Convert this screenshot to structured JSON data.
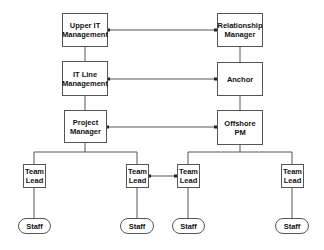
{
  "nodes": {
    "upper_it": {
      "label": "Upper IT Management"
    },
    "relationship_manager": {
      "label": "Relationship Manager"
    },
    "it_line": {
      "label": "IT Line Management"
    },
    "anchor": {
      "label": "Anchor"
    },
    "project_manager": {
      "label": "Project Manager"
    },
    "offshore_pm": {
      "label": "Offshore PM"
    },
    "team_lead_1": {
      "label": "Team Lead"
    },
    "team_lead_2": {
      "label": "Team Lead"
    },
    "team_lead_3": {
      "label": "Team Lead"
    },
    "team_lead_4": {
      "label": "Team Lead"
    },
    "staff_1": {
      "label": "Staff"
    },
    "staff_2": {
      "label": "Staff"
    },
    "staff_3": {
      "label": "Staff"
    },
    "staff_4": {
      "label": "Staff"
    }
  },
  "colors": {
    "line": "#555555",
    "text": "#111111"
  }
}
